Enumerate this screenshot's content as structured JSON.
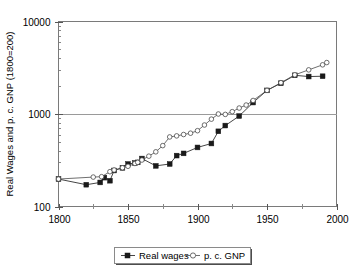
{
  "figure": {
    "name": "real-wages-and-per-capita-gnp-log-chart",
    "background_color": "#ffffff"
  },
  "chart_data": {
    "type": "line",
    "title": "",
    "xlabel": "",
    "ylabel": "Real Wages and p. c. GNP (1800=200)",
    "y_scale": "log",
    "ylim": [
      100,
      10000
    ],
    "xlim": [
      1800,
      2000
    ],
    "y_ticks": [
      "100",
      "1000",
      "10000"
    ],
    "y_tick_values": [
      100,
      1000,
      10000
    ],
    "x_ticks": [
      "1800",
      "1850",
      "1900",
      "1950",
      "2000"
    ],
    "x_tick_values": [
      1800,
      1850,
      1900,
      1950,
      2000
    ],
    "x_minor_tick_values": [
      1825,
      1875,
      1925,
      1975
    ],
    "grid": "horizontal-major-only",
    "legend_position": "below-plot",
    "series": [
      {
        "name": "Real wages",
        "marker": "filled-square",
        "color": "#1a1a1a",
        "x": [
          1800,
          1820,
          1830,
          1833,
          1837,
          1840,
          1846,
          1850,
          1855,
          1857,
          1860,
          1870,
          1880,
          1885,
          1890,
          1900,
          1910,
          1915,
          1920,
          1930,
          1940,
          1950,
          1960,
          1970,
          1980,
          1990
        ],
        "y": [
          198,
          172,
          182,
          205,
          190,
          245,
          262,
          288,
          295,
          300,
          330,
          275,
          288,
          355,
          375,
          435,
          480,
          650,
          750,
          950,
          1330,
          1800,
          2150,
          2620,
          2540,
          2560
        ]
      },
      {
        "name": "p. c. GNP",
        "marker": "open-circle",
        "color": "#4a4a4a",
        "x": [
          1800,
          1825,
          1831,
          1837,
          1840,
          1846,
          1850,
          1855,
          1857,
          1860,
          1865,
          1870,
          1875,
          1880,
          1885,
          1890,
          1895,
          1900,
          1905,
          1910,
          1915,
          1920,
          1925,
          1930,
          1935,
          1940,
          1950,
          1960,
          1970,
          1980,
          1990,
          1993
        ],
        "y": [
          198,
          208,
          210,
          238,
          248,
          262,
          272,
          292,
          300,
          318,
          350,
          390,
          455,
          565,
          580,
          600,
          620,
          660,
          760,
          880,
          1000,
          990,
          1060,
          1160,
          1250,
          1400,
          1800,
          2180,
          2650,
          3000,
          3400,
          3600
        ]
      }
    ]
  },
  "legend": {
    "items": [
      {
        "label": "Real wages",
        "marker": "filled-square"
      },
      {
        "label": "p. c. GNP",
        "marker": "open-circle"
      }
    ]
  },
  "axis": {
    "y_title": "Real Wages and p. c. GNP (1800=200)"
  }
}
